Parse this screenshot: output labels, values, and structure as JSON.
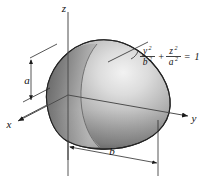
{
  "figure": {
    "background_color": "#ffffff",
    "line_color": "#1a1a1a",
    "surface_light": "#e8e8e8",
    "surface_mid": "#9a9a9a",
    "surface_dark": "#4a4a4a"
  },
  "axes": {
    "x_label": "x",
    "y_label": "y",
    "z_label": "z"
  },
  "dimensions": {
    "semi_axis_vertical_label": "a",
    "semi_axis_horizontal_label": "b"
  },
  "equation": {
    "numerator_1": "y",
    "denominator_1": "b",
    "numerator_2": "z",
    "denominator_2": "a",
    "exponent": "2",
    "plus": "+",
    "equals": "=",
    "right_hand_side": "1",
    "full_text": "y²/b² + z²/a² = 1"
  }
}
